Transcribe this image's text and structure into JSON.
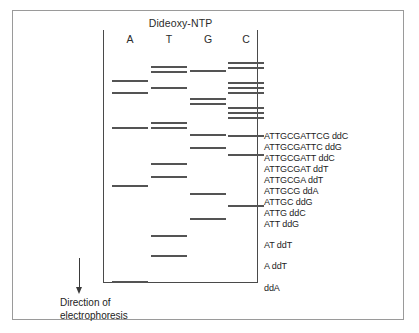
{
  "figure": {
    "type": "sanger-sequencing-gel-diagram",
    "title": "Dideoxy-NTP",
    "direction_caption_line1": "Direction of",
    "direction_caption_line2": "electrophoresis",
    "arrow_icon": "down-arrow-icon"
  },
  "lanes": [
    {
      "label": "A",
      "x": 112
    },
    {
      "label": "T",
      "x": 151
    },
    {
      "label": "G",
      "x": 190
    },
    {
      "label": "C",
      "x": 228
    }
  ],
  "bands": {
    "A": [
      {
        "y": 80
      },
      {
        "y": 92
      },
      {
        "y": 127
      },
      {
        "y": 185
      },
      {
        "y": 281
      }
    ],
    "T": [
      {
        "y": 66
      },
      {
        "y": 71
      },
      {
        "y": 87
      },
      {
        "y": 122
      },
      {
        "y": 127
      },
      {
        "y": 163
      },
      {
        "y": 176
      },
      {
        "y": 235
      },
      {
        "y": 255
      }
    ],
    "G": [
      {
        "y": 70
      },
      {
        "y": 98
      },
      {
        "y": 103
      },
      {
        "y": 134
      },
      {
        "y": 147
      },
      {
        "y": 193
      },
      {
        "y": 218
      }
    ],
    "C": [
      {
        "y": 62
      },
      {
        "y": 67
      },
      {
        "y": 82
      },
      {
        "y": 87
      },
      {
        "y": 92
      },
      {
        "y": 107
      },
      {
        "y": 112
      },
      {
        "y": 117
      },
      {
        "y": 135
      },
      {
        "y": 154
      },
      {
        "y": 205
      }
    ]
  },
  "sequence_labels": [
    {
      "text": "ATTGCGATTCG  ddC",
      "y": 131
    },
    {
      "text": "ATTGCGATTC  ddG",
      "y": 142
    },
    {
      "text": "ATTGCGATT  ddC",
      "y": 153
    },
    {
      "text": "ATTGCGAT  ddT",
      "y": 164
    },
    {
      "text": "ATTGCGA  ddT",
      "y": 175
    },
    {
      "text": "ATTGCG  ddA",
      "y": 186
    },
    {
      "text": "ATTGC  ddG",
      "y": 197
    },
    {
      "text": "ATTG  ddC",
      "y": 208
    },
    {
      "text": "ATT  ddG",
      "y": 219
    },
    {
      "text": "AT  ddT",
      "y": 240
    },
    {
      "text": "A  ddT",
      "y": 261
    },
    {
      "text": "ddA",
      "y": 283
    }
  ],
  "colors": {
    "band": "#545454",
    "gel_rule": "#4a4a4a",
    "outer_frame": "#9a9a9a",
    "text": "#232323",
    "background": "#ffffff"
  }
}
